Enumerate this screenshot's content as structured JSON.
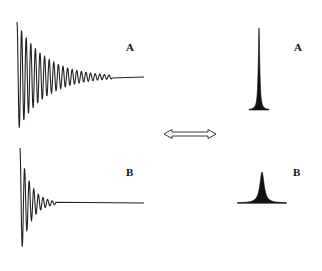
{
  "figure": {
    "panels": [
      {
        "id": "A",
        "signal_label": "A",
        "spectrum_label": "A",
        "decay": "slow",
        "peak": "narrow"
      },
      {
        "id": "B",
        "signal_label": "B",
        "spectrum_label": "B",
        "decay": "fast",
        "peak": "broad"
      }
    ],
    "arrow": {
      "type": "double-headed",
      "meaning": "transform between domains"
    },
    "colors": {
      "line": "#222222",
      "fill": "#111111",
      "background": "#ffffff"
    }
  }
}
